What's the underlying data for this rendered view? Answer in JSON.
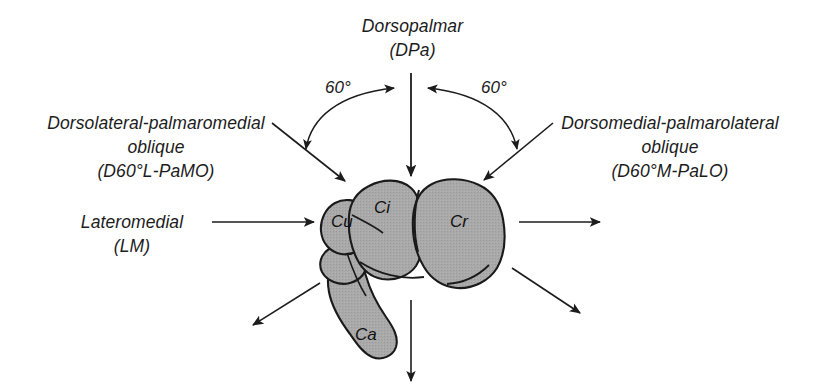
{
  "figure": {
    "kind": "radiographic-projection-diagram",
    "background_color": "#ffffff",
    "line_color": "#1c1c1c",
    "bone_fill_color": "#a8a8a8",
    "bone_outline_color": "#1a1a1a"
  },
  "projections": {
    "dorsopalmar": {
      "name": "Dorsopalmar",
      "abbrev": "(DPa)"
    },
    "dorsolateral_palmaromedial": {
      "name": "Dorsolateral-palmaromedial",
      "qualifier": "oblique",
      "abbrev": "(D60°L-PaMO)"
    },
    "dorsomedial_palmarolateral": {
      "name": "Dorsomedial-palmarolateral",
      "qualifier": "oblique",
      "abbrev": "(D60°M-PaLO)"
    },
    "lateromedial": {
      "name": "Lateromedial",
      "abbrev": "(LM)"
    }
  },
  "angles": {
    "left": "60°",
    "right": "60°"
  },
  "bones": [
    {
      "code": "Cu",
      "name": "carpal-ulnar"
    },
    {
      "code": "Ci",
      "name": "carpal-intermediate"
    },
    {
      "code": "Cr",
      "name": "carpal-radial"
    },
    {
      "code": "Ca",
      "name": "carpal-accessory"
    }
  ],
  "arrows": {
    "dorsopalmar_beam": "vertical-down-into-carpus",
    "left_oblique_beam": "diagonal-down-right-into-carpus",
    "right_oblique_beam": "diagonal-down-left-into-carpus",
    "lateromedial_beam": "horizontal-right-into-carpus",
    "exit_right": "horizontal-right-out-of-carpus",
    "exit_lower_right": "diagonal-down-right-out-of-carpus",
    "exit_lower_left": "diagonal-down-left-out-of-carpus",
    "exit_bottom": "vertical-down-out-of-carpus",
    "arc_left": "curved-arc-60-degrees-left",
    "arc_right": "curved-arc-60-degrees-right"
  }
}
